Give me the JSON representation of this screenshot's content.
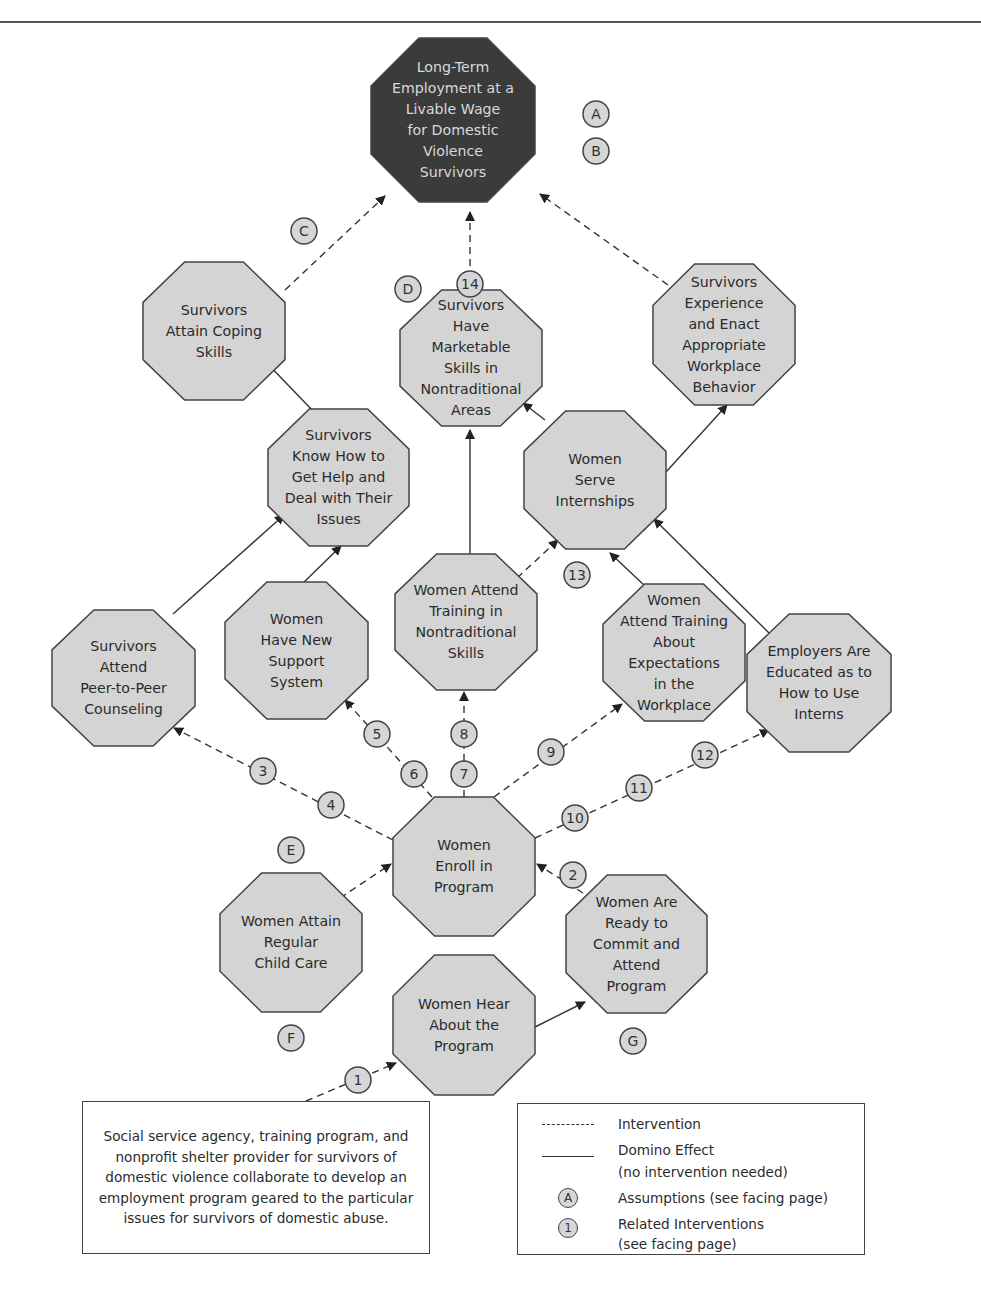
{
  "diagram": {
    "colors": {
      "goal_fill": "#3b3b3b",
      "node_fill": "#d4d4d4",
      "node_stroke": "#444444",
      "badge_fill": "#d6d6d6",
      "line": "#333333"
    },
    "nodes": [
      {
        "id": "goal",
        "kind": "goal",
        "x": 371,
        "y": 38,
        "w": 164,
        "h": 164,
        "lines": [
          "Long-Term",
          "Employment at a",
          "Livable Wage",
          "for Domestic",
          "Violence",
          "Survivors"
        ]
      },
      {
        "id": "coping",
        "x": 143,
        "y": 262,
        "w": 142,
        "h": 138,
        "lines": [
          "Survivors",
          "Attain Coping",
          "Skills"
        ]
      },
      {
        "id": "marketable",
        "x": 400,
        "y": 290,
        "w": 142,
        "h": 136,
        "lines": [
          "Survivors",
          "Have",
          "Marketable",
          "Skills in",
          "Nontraditional",
          "Areas"
        ]
      },
      {
        "id": "workplace_behavior",
        "x": 653,
        "y": 264,
        "w": 142,
        "h": 141,
        "lines": [
          "Survivors",
          "Experience",
          "and Enact",
          "Appropriate",
          "Workplace",
          "Behavior"
        ]
      },
      {
        "id": "know_help",
        "x": 268,
        "y": 409,
        "w": 141,
        "h": 137,
        "lines": [
          "Survivors",
          "Know How to",
          "Get Help and",
          "Deal with Their",
          "Issues"
        ]
      },
      {
        "id": "internships",
        "x": 524,
        "y": 411,
        "w": 142,
        "h": 138,
        "lines": [
          "Women",
          "Serve",
          "Internships"
        ]
      },
      {
        "id": "peer_counseling",
        "x": 52,
        "y": 610,
        "w": 143,
        "h": 136,
        "lines": [
          "Survivors",
          "Attend",
          "Peer-to-Peer",
          "Counseling"
        ]
      },
      {
        "id": "support_system",
        "x": 225,
        "y": 582,
        "w": 143,
        "h": 137,
        "lines": [
          "Women",
          "Have New",
          "Support",
          "System"
        ]
      },
      {
        "id": "training_nontrad",
        "x": 395,
        "y": 554,
        "w": 142,
        "h": 136,
        "lines": [
          "Women Attend",
          "Training in",
          "Nontraditional",
          "Skills"
        ]
      },
      {
        "id": "training_expect",
        "x": 603,
        "y": 584,
        "w": 142,
        "h": 137,
        "lines": [
          "Women",
          "Attend Training",
          "About",
          "Expectations",
          "in the",
          "Workplace"
        ]
      },
      {
        "id": "employers",
        "x": 747,
        "y": 614,
        "w": 144,
        "h": 138,
        "lines": [
          "Employers Are",
          "Educated as to",
          "How to Use",
          "Interns"
        ]
      },
      {
        "id": "enroll",
        "x": 393,
        "y": 797,
        "w": 142,
        "h": 139,
        "lines": [
          "Women",
          "Enroll in",
          "Program"
        ]
      },
      {
        "id": "child_care",
        "x": 220,
        "y": 873,
        "w": 142,
        "h": 139,
        "lines": [
          "Women Attain",
          "Regular",
          "Child Care"
        ]
      },
      {
        "id": "ready",
        "x": 566,
        "y": 875,
        "w": 141,
        "h": 138,
        "lines": [
          "Women Are",
          "Ready to",
          "Commit and",
          "Attend",
          "Program"
        ]
      },
      {
        "id": "hear",
        "x": 393,
        "y": 955,
        "w": 142,
        "h": 140,
        "lines": [
          "Women Hear",
          "About the",
          "Program"
        ]
      }
    ],
    "edges": [
      {
        "type": "intervention",
        "from": [
          285,
          290
        ],
        "to": [
          385,
          196
        ]
      },
      {
        "type": "intervention",
        "from": [
          470,
          290
        ],
        "to": [
          470,
          212
        ]
      },
      {
        "type": "intervention",
        "from": [
          668,
          285
        ],
        "to": [
          540,
          194
        ]
      },
      {
        "type": "domino",
        "from": [
          314,
          412
        ],
        "to": [
          262,
          358
        ]
      },
      {
        "type": "domino",
        "from": [
          470,
          554
        ],
        "to": [
          470,
          430
        ]
      },
      {
        "type": "domino",
        "from": [
          545,
          420
        ],
        "to": [
          523,
          403
        ]
      },
      {
        "type": "domino",
        "from": [
          666,
          472
        ],
        "to": [
          727,
          405
        ]
      },
      {
        "type": "domino",
        "from": [
          173,
          614
        ],
        "to": [
          284,
          515
        ]
      },
      {
        "type": "domino",
        "from": [
          301,
          585
        ],
        "to": [
          341,
          546
        ]
      },
      {
        "type": "intervention",
        "from": [
          517,
          578
        ],
        "to": [
          558,
          540
        ]
      },
      {
        "type": "domino",
        "from": [
          645,
          586
        ],
        "to": [
          610,
          553
        ]
      },
      {
        "type": "domino",
        "from": [
          770,
          634
        ],
        "to": [
          654,
          519
        ]
      },
      {
        "type": "intervention",
        "from": [
          393,
          840
        ],
        "to": [
          174,
          728
        ]
      },
      {
        "type": "intervention",
        "from": [
          432,
          797
        ],
        "to": [
          345,
          700
        ]
      },
      {
        "type": "intervention",
        "from": [
          464,
          797
        ],
        "to": [
          464,
          692
        ]
      },
      {
        "type": "intervention",
        "from": [
          494,
          797
        ],
        "to": [
          622,
          704
        ]
      },
      {
        "type": "intervention",
        "from": [
          535,
          838
        ],
        "to": [
          769,
          730
        ]
      },
      {
        "type": "intervention",
        "from": [
          340,
          898
        ],
        "to": [
          391,
          864
        ]
      },
      {
        "type": "intervention",
        "from": [
          583,
          893
        ],
        "to": [
          537,
          864
        ]
      },
      {
        "type": "domino",
        "from": [
          535,
          1027
        ],
        "to": [
          585,
          1002
        ]
      },
      {
        "type": "intervention",
        "from": [
          306,
          1101
        ],
        "to": [
          396,
          1063
        ]
      }
    ],
    "badges": [
      {
        "label": "A",
        "x": 596,
        "y": 114
      },
      {
        "label": "B",
        "x": 596,
        "y": 151
      },
      {
        "label": "C",
        "x": 304,
        "y": 231
      },
      {
        "label": "D",
        "x": 408,
        "y": 289
      },
      {
        "label": "14",
        "x": 470,
        "y": 284
      },
      {
        "label": "13",
        "x": 577,
        "y": 575
      },
      {
        "label": "5",
        "x": 377,
        "y": 734
      },
      {
        "label": "8",
        "x": 464,
        "y": 734
      },
      {
        "label": "9",
        "x": 551,
        "y": 752
      },
      {
        "label": "12",
        "x": 705,
        "y": 755
      },
      {
        "label": "3",
        "x": 263,
        "y": 771
      },
      {
        "label": "6",
        "x": 414,
        "y": 774
      },
      {
        "label": "7",
        "x": 464,
        "y": 774
      },
      {
        "label": "11",
        "x": 639,
        "y": 788
      },
      {
        "label": "4",
        "x": 331,
        "y": 805
      },
      {
        "label": "10",
        "x": 575,
        "y": 818
      },
      {
        "label": "E",
        "x": 291,
        "y": 850
      },
      {
        "label": "2",
        "x": 573,
        "y": 875
      },
      {
        "label": "F",
        "x": 291,
        "y": 1038
      },
      {
        "label": "G",
        "x": 633,
        "y": 1041
      },
      {
        "label": "1",
        "x": 358,
        "y": 1080
      }
    ]
  },
  "source_box": {
    "text": "Social service agency, training program, and nonprofit shelter provider for survivors of domestic violence collaborate to develop an employment program geared to the particular issues for survivors of domestic abuse."
  },
  "legend": {
    "items": [
      {
        "symbol": "dashed-line",
        "label": "Intervention"
      },
      {
        "symbol": "solid-line",
        "label": "Domino Effect",
        "sublabel": "(no intervention needed)"
      },
      {
        "symbol": "circle-letter",
        "glyph": "A",
        "label": "Assumptions (see facing page)"
      },
      {
        "symbol": "circle-number",
        "glyph": "1",
        "label": "Related Interventions",
        "sublabel": "(see facing page)"
      }
    ]
  }
}
